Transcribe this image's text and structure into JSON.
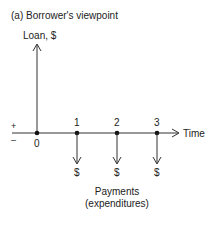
{
  "figure": {
    "title": "(a)  Borrower's viewpoint",
    "y_axis_label": "Loan, $",
    "x_axis_label": "Time",
    "sign_plus": "+",
    "sign_minus": "–",
    "origin_label": "0",
    "periods": [
      "1",
      "2",
      "3"
    ],
    "payment_symbols": [
      "$",
      "$",
      "$"
    ],
    "payments_caption_line1": "Payments",
    "payments_caption_line2": "(expenditures)",
    "line_color": "#333333"
  }
}
